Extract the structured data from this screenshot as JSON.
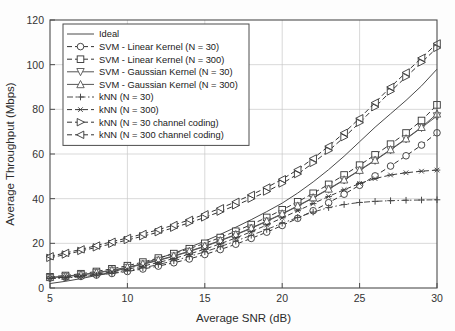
{
  "chart_data": {
    "type": "line",
    "title": "",
    "xlabel": "Average SNR (dB)",
    "ylabel": "Average Throughput (Mbps)",
    "xlim": [
      5,
      30
    ],
    "ylim": [
      0,
      120
    ],
    "xticks": [
      5,
      10,
      15,
      20,
      25,
      30
    ],
    "yticks": [
      0,
      20,
      40,
      60,
      80,
      100,
      120
    ],
    "grid": true,
    "legend_position": "upper left",
    "x": [
      5,
      6,
      7,
      8,
      9,
      10,
      11,
      12,
      13,
      14,
      15,
      16,
      17,
      18,
      19,
      20,
      21,
      22,
      23,
      24,
      25,
      26,
      27,
      28,
      29,
      30
    ],
    "series": [
      {
        "name": "Ideal",
        "marker": "none",
        "linestyle": "solid",
        "color": "#4a4a4a",
        "values": [
          2.0,
          3.0,
          4.2,
          5.6,
          7.2,
          9.0,
          11.0,
          13.2,
          15.6,
          18.2,
          21.0,
          24.0,
          27.2,
          30.6,
          34.2,
          38.0,
          42.5,
          47.5,
          53.0,
          59.0,
          65.5,
          72.0,
          78.0,
          84.0,
          90.5,
          98.0
        ]
      },
      {
        "name": "SVM - Linear Kernel (N = 30)",
        "marker": "circle",
        "linestyle": "dashed",
        "color": "#333333",
        "values": [
          4.5,
          4.8,
          5.2,
          5.8,
          6.5,
          7.4,
          8.5,
          9.8,
          11.3,
          13.0,
          15.0,
          17.2,
          19.6,
          22.2,
          25.0,
          28.0,
          31.2,
          34.6,
          38.2,
          42.0,
          46.0,
          50.2,
          54.6,
          59.2,
          64.0,
          69.5
        ]
      },
      {
        "name": "SVM - Linear Kernel (N = 300)",
        "marker": "square",
        "linestyle": "dashed",
        "color": "#333333",
        "values": [
          5.0,
          5.6,
          6.4,
          7.4,
          8.6,
          10.0,
          11.6,
          13.4,
          15.4,
          17.6,
          20.0,
          22.6,
          25.4,
          28.4,
          31.6,
          35.0,
          38.6,
          42.4,
          46.4,
          50.6,
          55.0,
          59.6,
          64.4,
          69.4,
          75.0,
          82.0
        ]
      },
      {
        "name": "SVM - Gaussian Kernel (N = 30)",
        "marker": "triangle-down",
        "linestyle": "solid",
        "color": "#555555",
        "values": [
          4.6,
          5.1,
          5.8,
          6.7,
          7.8,
          9.1,
          10.6,
          12.3,
          14.2,
          16.3,
          18.6,
          21.1,
          23.8,
          26.7,
          29.8,
          33.1,
          36.6,
          40.3,
          44.2,
          48.3,
          52.6,
          57.1,
          61.8,
          66.7,
          71.8,
          77.0
        ]
      },
      {
        "name": "SVM - Gaussian Kernel (N = 300)",
        "marker": "triangle-up",
        "linestyle": "solid",
        "color": "#555555",
        "values": [
          4.8,
          5.3,
          6.0,
          6.9,
          8.0,
          9.3,
          10.8,
          12.5,
          14.4,
          16.5,
          18.8,
          21.3,
          24.0,
          26.9,
          30.0,
          33.3,
          36.8,
          40.5,
          44.4,
          48.5,
          52.8,
          57.3,
          62.0,
          66.9,
          72.0,
          78.0
        ]
      },
      {
        "name": "kNN (N = 30)",
        "marker": "plus",
        "linestyle": "dashdot",
        "color": "#4a4a4a",
        "values": [
          4.2,
          4.5,
          5.0,
          5.7,
          6.6,
          7.7,
          9.0,
          10.5,
          12.2,
          14.1,
          16.2,
          18.5,
          21.0,
          23.6,
          26.2,
          29.0,
          31.6,
          34.0,
          36.0,
          37.4,
          38.3,
          38.8,
          39.1,
          39.3,
          39.4,
          39.5
        ]
      },
      {
        "name": "kNN (N = 300)",
        "marker": "asterisk",
        "linestyle": "dashed",
        "color": "#3a3a3a",
        "values": [
          4.4,
          4.8,
          5.4,
          6.2,
          7.2,
          8.4,
          9.8,
          11.4,
          13.2,
          15.2,
          17.4,
          19.8,
          22.4,
          25.2,
          28.2,
          31.4,
          34.6,
          37.8,
          41.0,
          44.0,
          46.8,
          49.0,
          50.6,
          51.6,
          52.3,
          52.8
        ]
      },
      {
        "name": "kNN (N = 30 channel coding)",
        "marker": "triangle-right",
        "linestyle": "dashed",
        "color": "#333333",
        "values": [
          13.5,
          15.0,
          16.6,
          18.2,
          19.8,
          21.5,
          23.2,
          25.0,
          27.0,
          29.2,
          31.6,
          34.2,
          37.0,
          40.0,
          43.2,
          46.8,
          51.0,
          56.0,
          61.5,
          67.5,
          74.0,
          81.0,
          88.0,
          94.5,
          101.0,
          107.5
        ]
      },
      {
        "name": "kNN (N = 300 channel coding)",
        "marker": "triangle-left",
        "linestyle": "dashed",
        "color": "#333333",
        "values": [
          14.2,
          15.7,
          17.3,
          19.0,
          20.7,
          22.4,
          24.2,
          26.1,
          28.2,
          30.5,
          33.0,
          35.7,
          38.6,
          41.7,
          45.0,
          48.7,
          53.0,
          58.0,
          63.5,
          69.5,
          76.0,
          83.0,
          90.0,
          96.5,
          103.0,
          109.5
        ]
      }
    ]
  },
  "legend": {
    "entries": [
      "Ideal",
      "SVM - Linear Kernel (N = 30)",
      "SVM - Linear Kernel (N = 300)",
      "SVM - Gaussian Kernel (N = 30)",
      "SVM - Gaussian Kernel (N = 300)",
      "kNN (N = 30)",
      "kNN (N = 300)",
      "kNN (N = 30 channel coding)",
      "kNN (N = 300 channel coding)"
    ]
  },
  "axes": {
    "x_label": "Average SNR (dB)",
    "y_label": "Average Throughput (Mbps)",
    "x_ticks": [
      "5",
      "10",
      "15",
      "20",
      "25",
      "30"
    ],
    "y_ticks": [
      "0",
      "20",
      "40",
      "60",
      "80",
      "100",
      "120"
    ]
  },
  "colors": {
    "axis": "#4d4d4d",
    "grid": "#c9c9c9",
    "background": "#fdfdfd",
    "text": "#222222"
  }
}
